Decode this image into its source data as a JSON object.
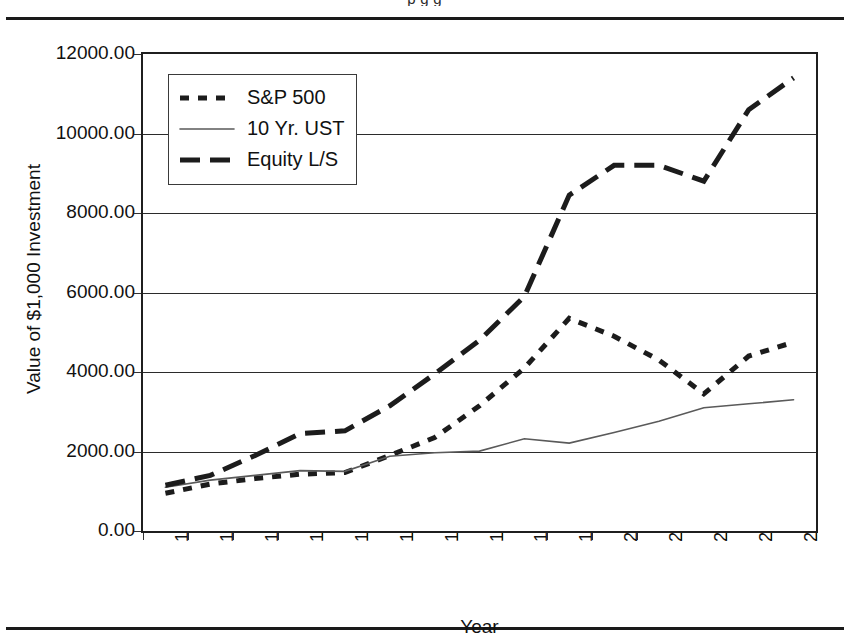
{
  "figure": {
    "clipped_caption_fragment": "p g g",
    "yaxis_title": "Value of $1,000 Investment",
    "xaxis_title": "Year"
  },
  "legend": {
    "position": "top-left-inside",
    "items": [
      {
        "label": "S&P 500",
        "style": "short-dash-thick",
        "color": "#1c1c1c"
      },
      {
        "label": "10 Yr. UST",
        "style": "thin-solid",
        "color": "#5a5a5a"
      },
      {
        "label": "Equity L/S",
        "style": "long-dash-thick",
        "color": "#1c1c1c"
      }
    ]
  },
  "chart_data": {
    "type": "line",
    "title": "",
    "subtitle": "",
    "xlabel": "Year",
    "ylabel": "Value of $1,000 Investment",
    "grid": true,
    "legend_position": "top-left",
    "categories": [
      "1990",
      "1991",
      "1992",
      "1993",
      "1994",
      "1995",
      "1996",
      "1997",
      "1998",
      "1999",
      "2000",
      "2001",
      "2002",
      "2003",
      "2004"
    ],
    "x": [
      1990,
      1991,
      1992,
      1993,
      1994,
      1995,
      1996,
      1997,
      1998,
      1999,
      2000,
      2001,
      2002,
      2003,
      2004
    ],
    "xlim": [
      1990,
      2004
    ],
    "ylim": [
      0,
      12000
    ],
    "yticks": [
      0,
      2000,
      4000,
      6000,
      8000,
      10000,
      12000
    ],
    "ytick_labels": [
      "0.00",
      "2000.00",
      "4000.00",
      "6000.00",
      "8000.00",
      "10000.00",
      "12000.00"
    ],
    "series": [
      {
        "name": "S&P 500",
        "style": "short-dash-thick",
        "color": "#1c1c1c",
        "values": [
          950,
          1180,
          1320,
          1430,
          1470,
          1900,
          2350,
          3150,
          4100,
          5350,
          4900,
          4300,
          3450,
          4400,
          4750
        ]
      },
      {
        "name": "10 Yr. UST",
        "style": "thin-solid",
        "color": "#5a5a5a",
        "values": [
          1100,
          1280,
          1400,
          1520,
          1500,
          1880,
          1970,
          2010,
          2320,
          2210,
          2480,
          2760,
          3100,
          3200,
          3300
        ]
      },
      {
        "name": "Equity L/S",
        "style": "long-dash-thick",
        "color": "#1c1c1c",
        "values": [
          1150,
          1400,
          1900,
          2450,
          2520,
          3150,
          3950,
          4800,
          5900,
          8450,
          9200,
          9200,
          8800,
          10600,
          11400
        ]
      }
    ]
  }
}
